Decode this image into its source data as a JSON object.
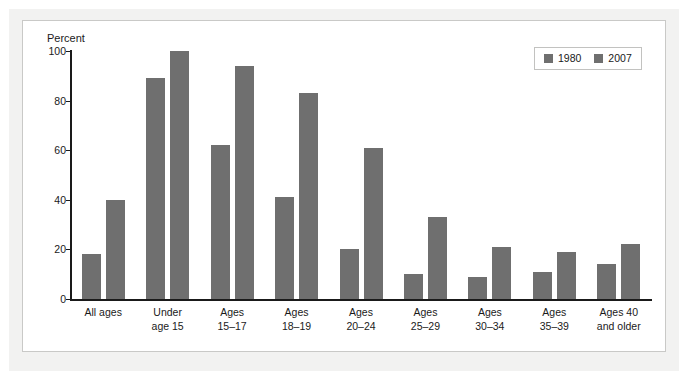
{
  "figure": {
    "y_axis_title": "Percent"
  },
  "legend": {
    "position": "top-right",
    "entries": [
      {
        "label": "1980",
        "color": "#6f6f6f",
        "swatch_name": "legend-swatch-1980"
      },
      {
        "label": "2007",
        "color": "#6f6f6f",
        "swatch_name": "legend-swatch-2007"
      }
    ]
  },
  "chart_data": {
    "type": "bar",
    "title": "",
    "subtitle": "",
    "xlabel": "",
    "ylabel": "Percent",
    "ylim": [
      0,
      100
    ],
    "yticks": [
      0,
      20,
      40,
      60,
      80,
      100
    ],
    "ytick_labels": [
      "0",
      "20",
      "40",
      "60",
      "80",
      "100"
    ],
    "grid": false,
    "legend_position": "top-right",
    "bar_color": "#6f6f6f",
    "categories": [
      "All ages",
      "Under\nage 15",
      "Ages\n15–17",
      "Ages\n18–19",
      "Ages\n20–24",
      "Ages\n25–29",
      "Ages\n30–34",
      "Ages\n35–39",
      "Ages 40\nand older"
    ],
    "series": [
      {
        "name": "1980",
        "color": "#6f6f6f",
        "values": [
          18,
          89,
          62,
          41,
          20,
          10,
          9,
          11,
          14
        ]
      },
      {
        "name": "2007",
        "color": "#6f6f6f",
        "values": [
          40,
          100,
          94,
          83,
          61,
          33,
          21,
          19,
          22
        ]
      }
    ]
  }
}
